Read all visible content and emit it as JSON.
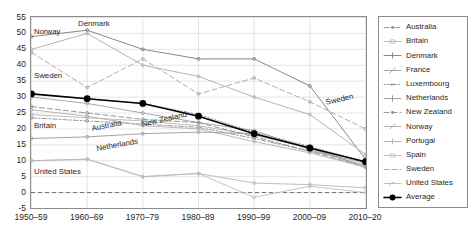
{
  "chart_data": {
    "type": "line",
    "title": "",
    "subtitle": "",
    "xlabel": "",
    "ylabel": "",
    "xlim": [
      0,
      6
    ],
    "ylim": [
      -5,
      55
    ],
    "grid": true,
    "legend_position": "right-outside",
    "categories": [
      "1950–59",
      "1960–69",
      "1970–79",
      "1980–89",
      "1990–99",
      "2000–09",
      "2010–20"
    ],
    "yticks": [
      "55",
      "50",
      "45",
      "40",
      "35",
      "30",
      "25",
      "20",
      "15",
      "10",
      "5",
      "0",
      "-5"
    ],
    "zero_line": 0,
    "series": [
      {
        "name": "Australia",
        "values": [
          23.5,
          22.5,
          21.5,
          20.5,
          17.0,
          13.0,
          9.5
        ]
      },
      {
        "name": "Britain",
        "values": [
          24.5,
          23.5,
          22.5,
          21.0,
          18.0,
          14.0,
          9.0
        ]
      },
      {
        "name": "Denmark",
        "values": [
          49.0,
          51.0,
          45.0,
          42.0,
          42.0,
          33.5,
          10.5
        ]
      },
      {
        "name": "France",
        "values": [
          30.0,
          28.0,
          25.0,
          22.0,
          19.5,
          13.5,
          8.5
        ]
      },
      {
        "name": "Luxembourg",
        "values": [
          31.0,
          29.5,
          28.0,
          24.5,
          19.0,
          14.5,
          9.5
        ]
      },
      {
        "name": "Netherlands",
        "values": [
          17.0,
          17.5,
          18.5,
          19.0,
          18.5,
          14.0,
          8.0
        ]
      },
      {
        "name": "New Zealand",
        "values": [
          27.0,
          25.0,
          23.0,
          22.0,
          17.5,
          13.0,
          8.0
        ]
      },
      {
        "name": "Norway",
        "values": [
          45.0,
          50.0,
          40.0,
          36.5,
          30.0,
          24.5,
          12.0
        ]
      },
      {
        "name": "Portugal",
        "values": [
          26.0,
          24.0,
          21.0,
          20.0,
          16.0,
          12.5,
          8.0
        ]
      },
      {
        "name": "Spain",
        "values": [
          10.0,
          10.5,
          5.0,
          6.0,
          -1.5,
          2.0,
          0.0
        ]
      },
      {
        "name": "Sweden",
        "values": [
          44.0,
          33.0,
          42.0,
          31.0,
          36.0,
          28.5,
          20.0
        ]
      },
      {
        "name": "United States",
        "values": [
          10.0,
          10.5,
          5.0,
          6.0,
          3.0,
          2.5,
          1.5
        ]
      },
      {
        "name": "Average",
        "values": [
          31.0,
          29.5,
          28.0,
          24.0,
          18.5,
          14.0,
          9.7
        ]
      }
    ],
    "annotations": [
      {
        "text": "Norway",
        "x": 34,
        "y": 28,
        "rotation": 0
      },
      {
        "text": "Denmark",
        "x": 78,
        "y": 20,
        "rotation": 0
      },
      {
        "text": "Sweden",
        "x": 34,
        "y": 72,
        "rotation": 0
      },
      {
        "text": "Britain",
        "x": 34,
        "y": 122,
        "rotation": 0
      },
      {
        "text": "Australia",
        "x": 91,
        "y": 125,
        "rotation": -11
      },
      {
        "text": "New Zealand",
        "x": 141,
        "y": 121,
        "rotation": -13
      },
      {
        "text": "Netherlands",
        "x": 96,
        "y": 145,
        "rotation": -10
      },
      {
        "text": "United States",
        "x": 34,
        "y": 168,
        "rotation": 0
      },
      {
        "text": "Sweden",
        "x": 325,
        "y": 99,
        "rotation": -13
      }
    ]
  },
  "legend": {
    "items": [
      {
        "label": "Australia",
        "style": "dashdot",
        "marker": "dot",
        "color": "#8f8f8f"
      },
      {
        "label": "Britain",
        "style": "solid",
        "marker": "circle",
        "color": "#b5b5b5"
      },
      {
        "label": "Denmark",
        "style": "solid",
        "marker": "plus",
        "color": "#7a7a7a"
      },
      {
        "label": "France",
        "style": "solid",
        "marker": "slash",
        "color": "#a0a0a0"
      },
      {
        "label": "Luxembourg",
        "style": "dotted",
        "marker": "dash",
        "color": "#8f8f8f"
      },
      {
        "label": "Netherlands",
        "style": "solid",
        "marker": "bar",
        "color": "#9a9a9a"
      },
      {
        "label": "New Zealand",
        "style": "dashed",
        "marker": "dot",
        "color": "#8a8a8a"
      },
      {
        "label": "Norway",
        "style": "solid",
        "marker": "slash",
        "color": "#ababab"
      },
      {
        "label": "Portugal",
        "style": "solid",
        "marker": "cross",
        "color": "#b0b0b0"
      },
      {
        "label": "Spain",
        "style": "solid",
        "marker": "circle",
        "color": "#bdbdbd"
      },
      {
        "label": "Sweden",
        "style": "dashed",
        "marker": "none",
        "color": "#a5a5a5"
      },
      {
        "label": "United States",
        "style": "solid",
        "marker": "curve",
        "color": "#b8b8b8"
      },
      {
        "label": "Average",
        "style": "solid-bold",
        "marker": "bigdot",
        "color": "#000000"
      }
    ]
  },
  "colors": {
    "frame": "#8c8c8c",
    "grid": "#dedede",
    "average": "#000000",
    "zero_dash": "#6f6f6f",
    "text": "#1f1f1f",
    "background": "#ffffff"
  }
}
